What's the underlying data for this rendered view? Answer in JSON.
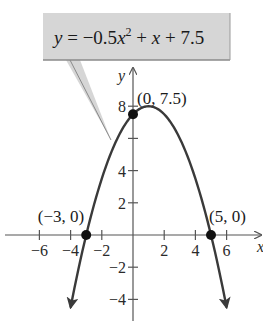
{
  "chart_data": {
    "type": "line",
    "equation": {
      "lhs": "y",
      "rhs_parts": [
        "−0.5",
        "x",
        "2",
        " + ",
        "x",
        " + 7.5"
      ],
      "a": -0.5,
      "b": 1,
      "c": 7.5
    },
    "xlabel": "x",
    "ylabel": "y",
    "xlim": [
      -8,
      8
    ],
    "ylim": [
      -5,
      10
    ],
    "x_ticks": [
      -6,
      -4,
      -2,
      2,
      4,
      6
    ],
    "x_tick_labels": [
      "−6",
      "−4",
      "−2",
      "2",
      "4",
      "6"
    ],
    "y_ticks": [
      -4,
      -2,
      2,
      4,
      6,
      8
    ],
    "y_tick_labels": [
      "−4",
      "−2",
      "2",
      "4",
      "",
      "8"
    ],
    "grid": false,
    "series": [
      {
        "name": "y = −0.5x² + x + 7.5",
        "x": [
          -4,
          -3,
          -2,
          -1,
          0,
          1,
          2,
          3,
          4,
          5,
          6
        ],
        "y": [
          -4.5,
          0,
          3.5,
          6,
          7.5,
          8,
          7.5,
          6,
          3.5,
          0,
          -4.5
        ],
        "color": "#3a3a3a"
      }
    ],
    "points": [
      {
        "x": 0,
        "y": 7.5,
        "label": "(0, 7.5)"
      },
      {
        "x": -3,
        "y": 0,
        "label": "(−3, 0)"
      },
      {
        "x": 5,
        "y": 0,
        "label": "(5, 0)"
      }
    ],
    "annotations": [
      {
        "type": "callout",
        "text": "y = −0.5x² + x + 7.5",
        "fill": "#d3d3d3"
      }
    ]
  },
  "labels": {
    "y_axis": "y",
    "x_axis": "x",
    "eq_y": "y",
    "eq_equals": " = −0.5",
    "eq_x1": "x",
    "eq_sup": "2",
    "eq_plus1": " + ",
    "eq_x2": "x",
    "eq_plus2": " + 7.5"
  }
}
